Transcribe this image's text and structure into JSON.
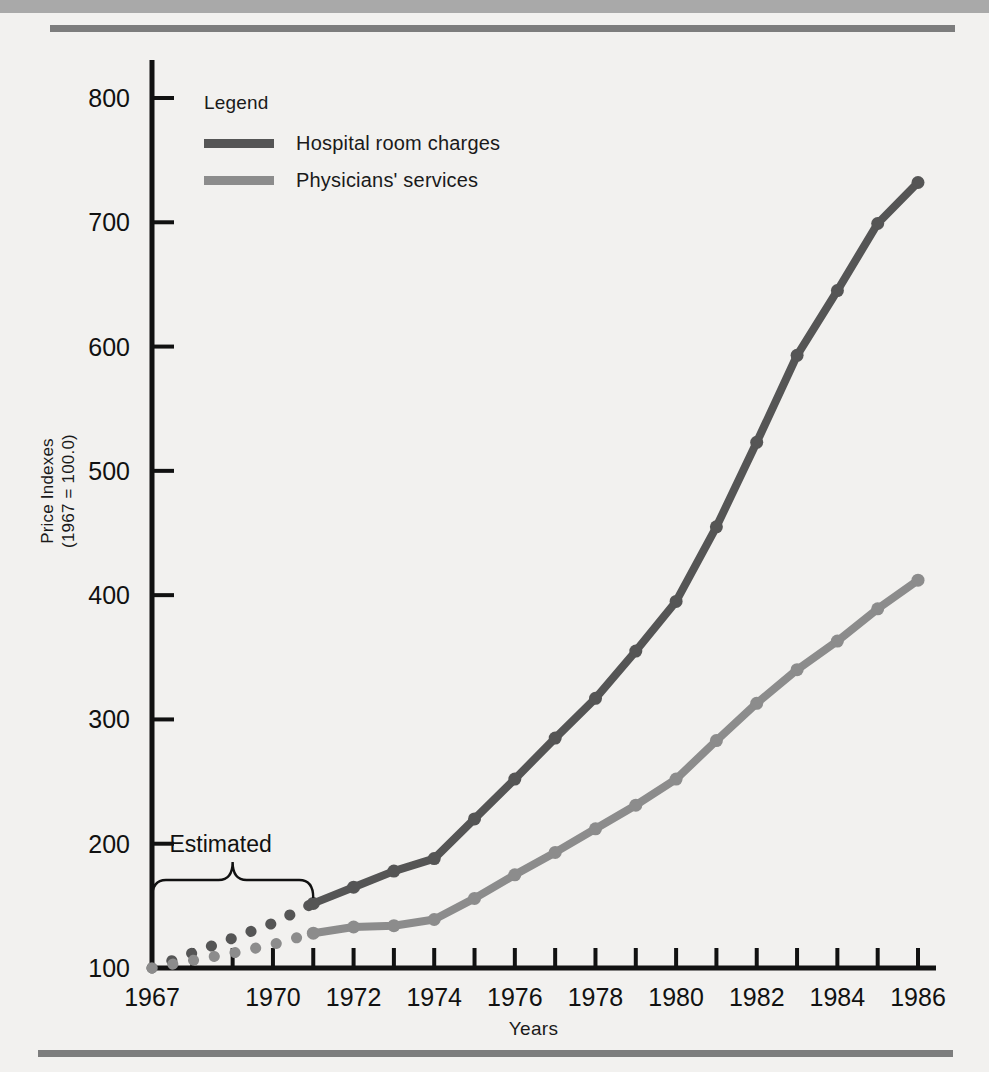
{
  "chart_data": {
    "type": "line",
    "title": "",
    "xlabel": "Years",
    "ylabel": "Price Indexes\n(1967 = 100.0)",
    "ylabel_line1": "Price Indexes",
    "ylabel_line2": "(1967 = 100.0)",
    "xlim": [
      1967,
      1986
    ],
    "ylim": [
      100,
      800
    ],
    "ytick_labels": [
      "100",
      "200",
      "300",
      "400",
      "500",
      "600",
      "700",
      "800"
    ],
    "ytick_values": [
      100,
      200,
      300,
      400,
      500,
      600,
      700,
      800
    ],
    "xtick_labels": [
      "1967",
      "1970",
      "1972",
      "1974",
      "1976",
      "1978",
      "1980",
      "1982",
      "1984",
      "1986"
    ],
    "xtick_values": [
      1967,
      1970,
      1972,
      1974,
      1976,
      1978,
      1980,
      1982,
      1984,
      1986
    ],
    "x": [
      1967,
      1968,
      1969,
      1970,
      1971,
      1972,
      1973,
      1974,
      1975,
      1976,
      1977,
      1978,
      1979,
      1980,
      1981,
      1982,
      1983,
      1984,
      1985,
      1986
    ],
    "grid": false,
    "legend_position": "upper-left-inside",
    "annotation": {
      "label": "Estimated",
      "span_start": 1967,
      "span_end": 1971,
      "style": "curly-brace"
    },
    "series": [
      {
        "name": "Hospital room charges",
        "color": "#555555",
        "estimated_through": 1971,
        "values": [
          100,
          112,
          124,
          136,
          152,
          165,
          178,
          188,
          220,
          252,
          285,
          317,
          355,
          395,
          455,
          523,
          593,
          645,
          699,
          732
        ]
      },
      {
        "name": "Physicians' services",
        "color": "#8c8c8c",
        "estimated_through": 1971,
        "values": [
          100,
          106,
          112,
          119,
          128,
          133,
          134,
          139,
          156,
          175,
          193,
          212,
          231,
          252,
          283,
          313,
          340,
          363,
          389,
          412
        ]
      }
    ]
  },
  "legend": {
    "title": "Legend",
    "items": [
      {
        "label": "Hospital room charges",
        "color": "#555555"
      },
      {
        "label": "Physicians' services",
        "color": "#8c8c8c"
      }
    ]
  },
  "axes": {
    "x_title": "Years",
    "y_title_line1": "Price Indexes",
    "y_title_line2": "(1967 = 100.0)"
  },
  "annotation": {
    "estimated_label": "Estimated"
  }
}
